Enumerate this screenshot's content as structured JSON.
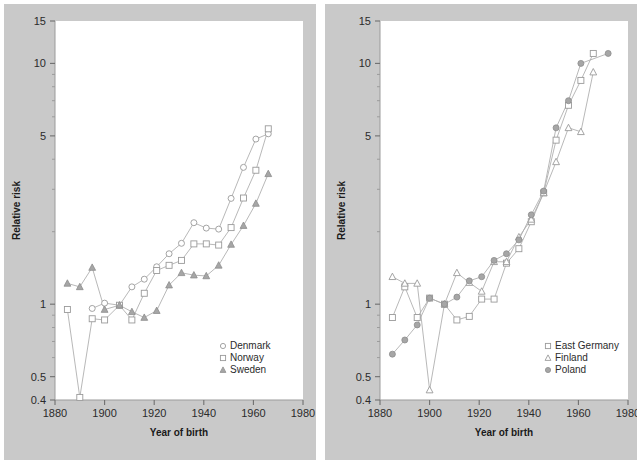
{
  "figure": {
    "background_color": "#c9c9c9",
    "plot_background_color": "#ffffff",
    "panels": 2
  },
  "chart_data": [
    {
      "panel": "left",
      "type": "line",
      "title": "",
      "xlabel": "Year of birth",
      "ylabel": "Relative risk",
      "yscale": "log",
      "xlim": [
        1880,
        1980
      ],
      "ylim": [
        0.4,
        15
      ],
      "xticks": [
        1880,
        1900,
        1920,
        1940,
        1960,
        1980
      ],
      "xticklabels": [
        "1880",
        "1900",
        "1920",
        "1940",
        "1960",
        "1980"
      ],
      "yticks": [
        0.4,
        0.5,
        1,
        5,
        10,
        15
      ],
      "yticklabels": [
        "0.4",
        "0.5",
        "1",
        "5",
        "10",
        "15"
      ],
      "grid": false,
      "legend_position": "lower right",
      "series": [
        {
          "name": "Denmark",
          "marker": "circle-open",
          "color": "#9a9a9a",
          "x": [
            1895,
            1900,
            1906,
            1911,
            1916,
            1921,
            1926,
            1931,
            1936,
            1941,
            1946,
            1951,
            1956,
            1961,
            1966
          ],
          "y": [
            0.96,
            1.01,
            0.99,
            1.18,
            1.27,
            1.43,
            1.62,
            1.79,
            2.18,
            2.07,
            2.05,
            2.75,
            3.7,
            4.85,
            5.1
          ]
        },
        {
          "name": "Norway",
          "marker": "square-open",
          "color": "#9a9a9a",
          "x": [
            1885,
            1890,
            1895,
            1900,
            1906,
            1911,
            1916,
            1921,
            1926,
            1931,
            1936,
            1941,
            1946,
            1951,
            1956,
            1961,
            1966
          ],
          "y": [
            0.95,
            0.41,
            0.87,
            0.86,
            0.99,
            0.86,
            1.11,
            1.38,
            1.45,
            1.52,
            1.78,
            1.78,
            1.76,
            2.08,
            2.76,
            3.6,
            5.35
          ]
        },
        {
          "name": "Sweden",
          "marker": "triangle-filled",
          "color": "#9a9a9a",
          "x": [
            1885,
            1890,
            1895,
            1900,
            1906,
            1911,
            1916,
            1921,
            1926,
            1931,
            1936,
            1941,
            1946,
            1951,
            1956,
            1961,
            1966
          ],
          "y": [
            1.22,
            1.18,
            1.42,
            0.95,
            0.99,
            0.93,
            0.88,
            0.94,
            1.2,
            1.35,
            1.32,
            1.31,
            1.45,
            1.77,
            2.12,
            2.62,
            3.48
          ]
        }
      ]
    },
    {
      "panel": "right",
      "type": "line",
      "title": "",
      "xlabel": "Year of birth",
      "ylabel": "Relative risk",
      "yscale": "log",
      "xlim": [
        1880,
        1980
      ],
      "ylim": [
        0.4,
        15
      ],
      "xticks": [
        1880,
        1900,
        1920,
        1940,
        1960,
        1980
      ],
      "xticklabels": [
        "1880",
        "1900",
        "1920",
        "1940",
        "1960",
        "1980"
      ],
      "yticks": [
        0.4,
        0.5,
        1,
        5,
        10,
        15
      ],
      "yticklabels": [
        "0.4",
        "0.5",
        "1",
        "5",
        "10",
        "15"
      ],
      "grid": false,
      "legend_position": "lower right",
      "series": [
        {
          "name": "East Germany",
          "marker": "square-open",
          "color": "#9a9a9a",
          "x": [
            1885,
            1890,
            1895,
            1900,
            1906,
            1911,
            1916,
            1921,
            1926,
            1931,
            1936,
            1941,
            1946,
            1951,
            1956,
            1961,
            1966
          ],
          "y": [
            0.88,
            1.18,
            0.88,
            1.06,
            1.0,
            0.86,
            0.89,
            1.05,
            1.05,
            1.48,
            1.7,
            2.2,
            2.9,
            4.8,
            6.7,
            8.5,
            11.0
          ]
        },
        {
          "name": "Finland",
          "marker": "triangle-open",
          "color": "#9a9a9a",
          "x": [
            1885,
            1890,
            1895,
            1900,
            1906,
            1911,
            1916,
            1921,
            1926,
            1931,
            1936,
            1941,
            1946,
            1951,
            1956,
            1961,
            1966
          ],
          "y": [
            1.3,
            1.22,
            1.22,
            0.44,
            1.0,
            1.35,
            1.23,
            1.13,
            1.5,
            1.5,
            1.9,
            2.25,
            2.9,
            3.9,
            5.4,
            5.2,
            9.2
          ]
        },
        {
          "name": "Poland",
          "marker": "circle-filled",
          "color": "#9a9a9a",
          "x": [
            1885,
            1890,
            1895,
            1900,
            1906,
            1911,
            1916,
            1921,
            1926,
            1931,
            1936,
            1941,
            1946,
            1951,
            1956,
            1961,
            1972
          ],
          "y": [
            0.62,
            0.71,
            0.82,
            1.06,
            1.0,
            1.07,
            1.25,
            1.3,
            1.52,
            1.62,
            1.85,
            2.35,
            2.95,
            5.4,
            7.0,
            10.0,
            11.0
          ]
        }
      ]
    }
  ],
  "left_panel": {
    "ylabel": "Relative risk",
    "xlabel": "Year of birth",
    "xticklabels": [
      "1880",
      "1900",
      "1920",
      "1940",
      "1960",
      "1980"
    ],
    "yticklabels": [
      "15",
      "10",
      "5",
      "1",
      "0.5",
      "0.4"
    ],
    "legend": [
      {
        "label": "Denmark",
        "marker": "circle-open"
      },
      {
        "label": "Norway",
        "marker": "square-open"
      },
      {
        "label": "Sweden",
        "marker": "triangle-filled"
      }
    ]
  },
  "right_panel": {
    "ylabel": "Relative risk",
    "xlabel": "Year of birth",
    "xticklabels": [
      "1880",
      "1900",
      "1920",
      "1940",
      "1960",
      "1980"
    ],
    "yticklabels": [
      "15",
      "10",
      "5",
      "1",
      "0.5",
      "0.4"
    ],
    "legend": [
      {
        "label": "East Germany",
        "marker": "square-open"
      },
      {
        "label": "Finland",
        "marker": "triangle-open"
      },
      {
        "label": "Poland",
        "marker": "circle-filled"
      }
    ]
  }
}
